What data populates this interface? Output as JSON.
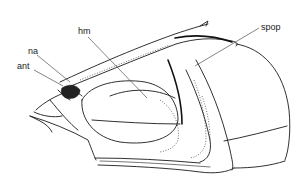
{
  "figure": {
    "labels": [
      {
        "id": "hm",
        "text": "hm"
      },
      {
        "id": "na",
        "text": "na"
      },
      {
        "id": "ant",
        "text": "ant"
      },
      {
        "id": "spop",
        "text": "spop"
      }
    ]
  },
  "colors": {
    "background": "#ffffff",
    "ink": "#1a1a1a"
  }
}
